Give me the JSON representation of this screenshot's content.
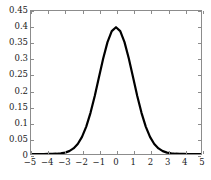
{
  "chart_data": {
    "type": "line",
    "title": "",
    "xlabel": "",
    "ylabel": "",
    "xlim": [
      -5,
      5
    ],
    "ylim": [
      0,
      0.45
    ],
    "grid": false,
    "legend": false,
    "x_ticks": [
      -5,
      -4,
      -3,
      -2,
      -1,
      0,
      1,
      2,
      3,
      4,
      5
    ],
    "x_tick_labels": [
      "−5",
      "−4",
      "−3",
      "−2",
      "−1",
      "0",
      "1",
      "2",
      "3",
      "4",
      "5"
    ],
    "y_ticks": [
      0,
      0.05,
      0.1,
      0.15,
      0.2,
      0.25,
      0.3,
      0.35,
      0.4,
      0.45
    ],
    "y_tick_labels": [
      "0",
      "0.05",
      "0.1",
      "0.15",
      "0.2",
      "0.25",
      "0.3",
      "0.35",
      "0.4",
      "0.45"
    ],
    "series": [
      {
        "name": "normal pdf",
        "color": "#000000",
        "line_width": 2.2,
        "x": [
          -5,
          -4.75,
          -4.5,
          -4.25,
          -4,
          -3.75,
          -3.5,
          -3.25,
          -3,
          -2.75,
          -2.5,
          -2.25,
          -2,
          -1.75,
          -1.5,
          -1.25,
          -1,
          -0.75,
          -0.5,
          -0.25,
          0,
          0.25,
          0.5,
          0.75,
          1,
          1.25,
          1.5,
          1.75,
          2,
          2.25,
          2.5,
          2.75,
          3,
          3.25,
          3.5,
          3.75,
          4,
          4.25,
          4.5,
          4.75,
          5
        ],
        "values": [
          1.5e-06,
          5.1e-06,
          1.6e-05,
          4.65e-05,
          0.0001338,
          0.000354,
          0.0008727,
          0.0020032,
          0.0044318,
          0.0090936,
          0.0175283,
          0.0316644,
          0.053991,
          0.0862773,
          0.1295176,
          0.1826491,
          0.2419707,
          0.3011374,
          0.3520653,
          0.3866681,
          0.3989423,
          0.3866681,
          0.3520653,
          0.3011374,
          0.2419707,
          0.1826491,
          0.1295176,
          0.0862773,
          0.053991,
          0.0316644,
          0.0175283,
          0.0090936,
          0.0044318,
          0.0020032,
          0.0008727,
          0.000354,
          0.0001338,
          4.65e-05,
          1.6e-05,
          5.1e-06,
          1.5e-06
        ]
      }
    ],
    "axis_color": "#8c8c8c",
    "background": "#ffffff"
  }
}
